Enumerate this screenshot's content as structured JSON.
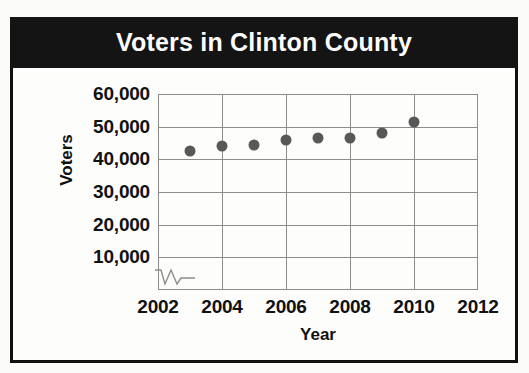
{
  "chart": {
    "title": "Voters in Clinton County",
    "y_axis_label": "Voters",
    "x_axis_label": "Year"
  },
  "chart_data": {
    "type": "scatter",
    "title": "Voters in Clinton County",
    "xlabel": "Year",
    "ylabel": "Voters",
    "x": [
      2003,
      2004,
      2005,
      2006,
      2007,
      2008,
      2009,
      2010
    ],
    "values": [
      42500,
      44000,
      44500,
      46000,
      46500,
      46500,
      48000,
      51500
    ],
    "xlim": [
      2002,
      2012
    ],
    "ylim": [
      0,
      60000
    ],
    "xticks": [
      2002,
      2004,
      2006,
      2008,
      2010,
      2012
    ],
    "yticks": [
      10000,
      20000,
      30000,
      40000,
      50000,
      60000
    ],
    "ytick_labels": [
      "10,000",
      "20,000",
      "30,000",
      "40,000",
      "50,000",
      "60,000"
    ],
    "xtick_labels": [
      "2002",
      "2004",
      "2006",
      "2008",
      "2010",
      "2012"
    ],
    "grid": true,
    "legend": null,
    "axis_break": "y-axis broken near origin",
    "marker_color": "#585858",
    "title_background": "#141414",
    "title_color": "#ffffff",
    "grid_color": "#8d8d8d"
  }
}
